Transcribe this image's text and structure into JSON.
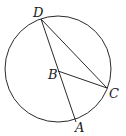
{
  "diagram": {
    "type": "circle-geometry",
    "circle": {
      "cx": 58,
      "cy": 69,
      "r": 53,
      "stroke": "#2a2a2a"
    },
    "points": {
      "D": {
        "x": 41,
        "y": 19,
        "label": "D",
        "lx": 33,
        "ly": 17
      },
      "B": {
        "x": 58,
        "y": 71,
        "label": "B",
        "lx": 48,
        "ly": 79
      },
      "C": {
        "x": 107,
        "y": 88,
        "label": "C",
        "lx": 109,
        "ly": 98
      },
      "A": {
        "x": 76,
        "y": 122,
        "label": "A",
        "lx": 75,
        "ly": 132
      }
    },
    "segments": [
      [
        "D",
        "A"
      ],
      [
        "D",
        "C"
      ],
      [
        "B",
        "C"
      ]
    ]
  }
}
